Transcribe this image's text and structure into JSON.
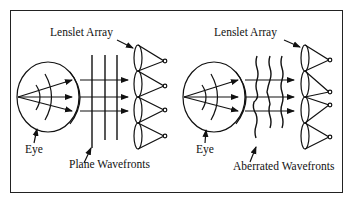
{
  "figure": {
    "type": "Shack-Hartmann wavefront sensor comparison diagram",
    "stroke_color": "#111111",
    "background": "#ffffff"
  },
  "panels": [
    {
      "id": "left",
      "labels": {
        "lenslet_array": "Lenslet Array",
        "eye": "Eye",
        "wavefronts": "Plane Wavefronts"
      },
      "wavefront_type": "plane",
      "lenslet_count": 4,
      "ray_count": 3
    },
    {
      "id": "right",
      "labels": {
        "lenslet_array": "Lenslet Array",
        "eye": "Eye",
        "wavefronts": "Aberrated Wavefronts"
      },
      "wavefront_type": "aberrated",
      "lenslet_count": 4,
      "ray_count": 3
    }
  ]
}
